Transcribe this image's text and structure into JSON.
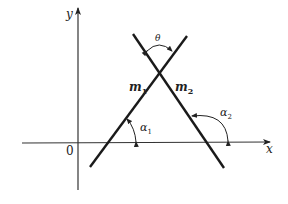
{
  "diagram": {
    "axes": {
      "x_label": "x",
      "y_label": "y",
      "origin_label": "0"
    },
    "lines": [
      {
        "id": "m1",
        "label": "m",
        "subscript": "1",
        "angle_label": "α",
        "angle_subscript": "1"
      },
      {
        "id": "m2",
        "label": "m",
        "subscript": "2",
        "angle_label": "α",
        "angle_subscript": "2"
      }
    ],
    "intersection_angle_label": "θ",
    "colors": {
      "line": "#1a1a1a",
      "axis": "#333333",
      "background": "#ffffff"
    }
  }
}
